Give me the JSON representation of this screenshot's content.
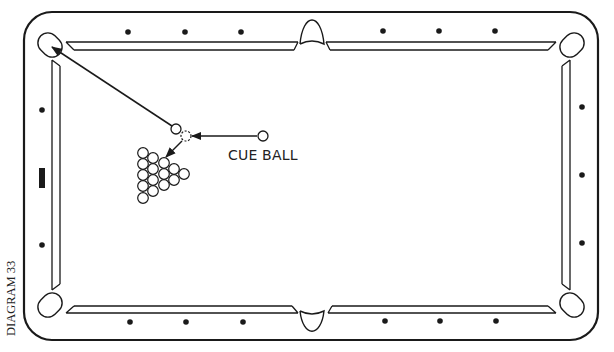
{
  "diagram": {
    "caption": "DIAGRAM 33",
    "cue_ball_label": "CUE BALL",
    "colors": {
      "line": "#1a1a1a",
      "background": "#ffffff",
      "diamond": "#1a1a1a"
    }
  },
  "table": {
    "outer_frame": {
      "x": 24,
      "y": 12,
      "width": 574,
      "height": 328,
      "radius": 28
    },
    "cushion_outer": {
      "left": 52,
      "right": 570,
      "top": 42,
      "bottom": 313
    },
    "cushion_inner": {
      "left": 60,
      "right": 562,
      "top": 50,
      "bottom": 306
    },
    "pockets": [
      {
        "name": "top-left",
        "cx": 50,
        "cy": 45
      },
      {
        "name": "top-middle",
        "cx": 312,
        "cy": 18
      },
      {
        "name": "top-right",
        "cx": 572,
        "cy": 45
      },
      {
        "name": "bottom-left",
        "cx": 50,
        "cy": 305
      },
      {
        "name": "bottom-middle",
        "cx": 312,
        "cy": 330
      },
      {
        "name": "bottom-right",
        "cx": 572,
        "cy": 305
      }
    ],
    "diamonds": {
      "top": [
        [
          128,
          32
        ],
        [
          185,
          32
        ],
        [
          241,
          32
        ],
        [
          383,
          31
        ],
        [
          439,
          31
        ],
        [
          495,
          31
        ]
      ],
      "bottom": [
        [
          130,
          322
        ],
        [
          186,
          322
        ],
        [
          243,
          322
        ],
        [
          385,
          321
        ],
        [
          440,
          321
        ],
        [
          496,
          321
        ]
      ],
      "left": [
        [
          42,
          110
        ],
        [
          42,
          245
        ]
      ],
      "right": [
        [
          582,
          107
        ],
        [
          582,
          175
        ],
        [
          582,
          243
        ]
      ]
    },
    "head_spot_marker": {
      "x": 39,
      "y": 168,
      "width": 6,
      "height": 20
    }
  },
  "balls": {
    "object_ball": {
      "cx": 176,
      "cy": 129,
      "r": 5
    },
    "ghost_ball": {
      "cx": 186,
      "cy": 136,
      "r": 5,
      "style": "dashed"
    },
    "cue_ball": {
      "cx": 263,
      "cy": 136,
      "r": 5
    },
    "rack": [
      [
        143,
        153
      ],
      [
        143,
        164
      ],
      [
        143,
        175
      ],
      [
        143,
        186
      ],
      [
        143,
        198
      ],
      [
        153,
        158
      ],
      [
        153,
        169
      ],
      [
        153,
        180
      ],
      [
        153,
        191
      ],
      [
        164,
        163
      ],
      [
        164,
        174
      ],
      [
        164,
        185
      ],
      [
        174,
        169
      ],
      [
        174,
        180
      ],
      [
        184,
        174
      ]
    ]
  },
  "paths": {
    "object_to_pocket": {
      "from": [
        172,
        126
      ],
      "to": [
        52,
        47
      ]
    },
    "cue_to_ghost": {
      "from": [
        257,
        136
      ],
      "to": [
        192,
        136
      ]
    },
    "ghost_to_rack": {
      "from": [
        182,
        141
      ],
      "to": [
        166,
        157
      ]
    }
  }
}
